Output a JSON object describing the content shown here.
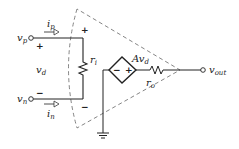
{
  "diagram": {
    "labels": {
      "vp": {
        "main": "v",
        "sub": "p"
      },
      "vn": {
        "main": "v",
        "sub": "n"
      },
      "ip": {
        "main": "i",
        "sub": "p"
      },
      "in": {
        "main": "i",
        "sub": "n"
      },
      "vd": {
        "main": "v",
        "sub": "d"
      },
      "ri": {
        "main": "r",
        "sub": "i"
      },
      "ro": {
        "main": "r",
        "sub": "o"
      },
      "gain": {
        "main": "Av",
        "sub": "d"
      },
      "vout": {
        "main": "v",
        "sub": "out"
      }
    },
    "signs": {
      "input_plus": "+",
      "input_minus": "−",
      "ri_plus": "+",
      "ri_minus": "−",
      "source_minus": "−",
      "source_plus": "+"
    },
    "components": [
      "input terminal vp",
      "input terminal vn",
      "input resistor ri",
      "dependent voltage source Avd",
      "output resistor ro",
      "output terminal vout",
      "ground",
      "dashed op-amp triangle outline"
    ],
    "colors": {
      "line": "#222222",
      "dashed": "#777777"
    }
  }
}
